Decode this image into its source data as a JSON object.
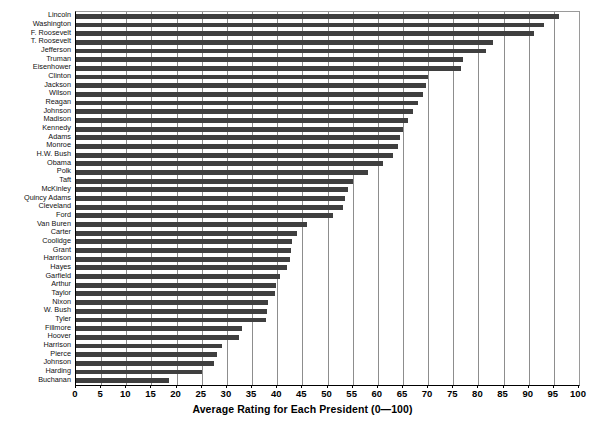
{
  "artifacts": {
    "top_strip_text": "",
    "bottom_strip_text": ""
  },
  "chart_data": {
    "type": "bar",
    "orientation": "horizontal",
    "title": "",
    "subtitle": "",
    "xlabel": "Average Rating for Each President (0—100)",
    "ylabel": "",
    "xlim": [
      0,
      100
    ],
    "grid": true,
    "legend": false,
    "legend_position": "none",
    "bar_color": "#3f3f3f",
    "axis_color": "#000000",
    "gridline_color": "#8d8d8d",
    "background_color": "#ffffff",
    "xticks": [
      0,
      5,
      10,
      15,
      20,
      25,
      30,
      35,
      40,
      45,
      50,
      55,
      60,
      65,
      70,
      75,
      80,
      85,
      90,
      95,
      100
    ],
    "xticklabels": [
      "0",
      "5",
      "10",
      "15",
      "20",
      "25",
      "30",
      "35",
      "40",
      "45",
      "50",
      "55",
      "60",
      "65",
      "70",
      "75",
      "80",
      "85",
      "90",
      "95",
      "100"
    ],
    "categories": [
      "Lincoln",
      "Washington",
      "F. Roosevelt",
      "T. Roosevelt",
      "Jefferson",
      "Truman",
      "Eisenhower",
      "Clinton",
      "Jackson",
      "Wilson",
      "Reagan",
      "Johnson",
      "Madison",
      "Kennedy",
      "Adams",
      "Monroe",
      "H.W. Bush",
      "Obama",
      "Polk",
      "Taft",
      "McKinley",
      "Quincy Adams",
      "Cleveland",
      "Ford",
      "Van Buren",
      "Carter",
      "Coolidge",
      "Grant",
      "Harrison",
      "Hayes",
      "Garfield",
      "Arthur",
      "Taylor",
      "Nixon",
      "W. Bush",
      "Tyler",
      "Fillmore",
      "Hoover",
      "Harrison",
      "Pierce",
      "Johnson",
      "Harding",
      "Buchanan"
    ],
    "values": [
      96.0,
      93.0,
      91.0,
      83.0,
      81.5,
      77.0,
      76.5,
      70.0,
      69.5,
      69.0,
      68.0,
      67.0,
      66.0,
      65.0,
      64.5,
      64.0,
      63.0,
      61.0,
      58.0,
      55.0,
      54.0,
      53.5,
      53.0,
      51.0,
      46.0,
      44.0,
      43.0,
      42.8,
      42.5,
      42.0,
      40.5,
      39.8,
      39.5,
      38.2,
      38.0,
      37.8,
      33.0,
      32.5,
      29.0,
      28.0,
      27.5,
      25.0,
      18.5
    ]
  }
}
